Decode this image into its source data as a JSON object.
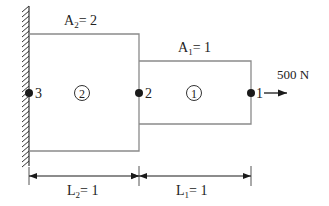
{
  "diagram": {
    "type": "stepped-bar-finite-element",
    "colors": {
      "outline": "#8a8a8a",
      "ink": "#1a1a1a",
      "wall_hatch": "#333333",
      "background": "#ffffff"
    },
    "labels": {
      "area2": {
        "symbol": "A",
        "subscript": "2",
        "rest": "= 2"
      },
      "area1": {
        "symbol": "A",
        "subscript": "1",
        "rest": "= 1"
      },
      "load": "500 N",
      "length2": {
        "symbol": "L",
        "subscript": "2",
        "rest": "= 1"
      },
      "length1": {
        "symbol": "L",
        "subscript": "1",
        "rest": "= 1"
      }
    },
    "nodes": [
      {
        "id": "1",
        "label": "1"
      },
      {
        "id": "2",
        "label": "2"
      },
      {
        "id": "3",
        "label": "3"
      }
    ],
    "elements": [
      {
        "id": "1",
        "label": "1"
      },
      {
        "id": "2",
        "label": "2"
      }
    ]
  }
}
